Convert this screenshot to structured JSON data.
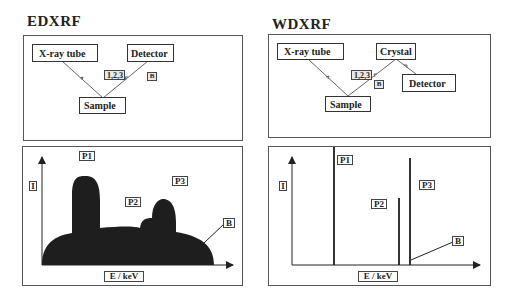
{
  "edxrf": {
    "title": "EDXRF",
    "schematic": {
      "source": "X-ray tube",
      "detector": "Detector",
      "sample": "Sample",
      "lines_label": "1,2,3",
      "background_label": "B"
    },
    "spectrum": {
      "y_label": "I",
      "x_label": "E / keV",
      "peaks": [
        "P1",
        "P2",
        "P3"
      ],
      "background_label": "B"
    }
  },
  "wdxrf": {
    "title": "WDXRF",
    "schematic": {
      "source": "X-ray tube",
      "crystal": "Crystal",
      "detector": "Detector",
      "sample": "Sample",
      "lines_label": "1,2,3",
      "background_label": "B"
    },
    "spectrum": {
      "y_label": "I",
      "x_label": "E / keV",
      "peaks": [
        "P1",
        "P2",
        "P3"
      ],
      "background_label": "B"
    }
  },
  "colors": {
    "ink": "#222222",
    "fill": "#1e1e1e",
    "border": "#555555"
  }
}
